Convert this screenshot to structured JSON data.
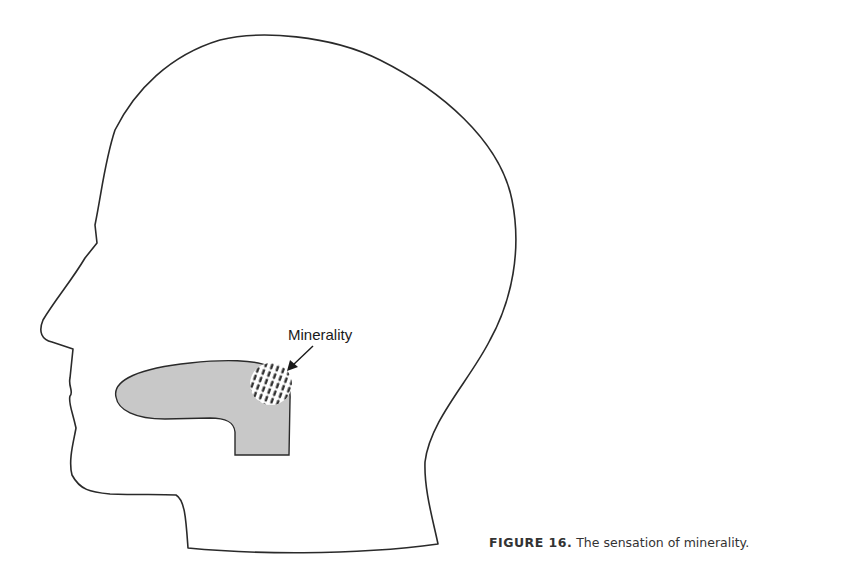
{
  "figure": {
    "label_text": "Minerality",
    "caption_number": "FIGURE 16.",
    "caption_text": " The sensation of minerality."
  },
  "colors": {
    "outline": "#2a2a2a",
    "tongue_fill": "#c8c8c8",
    "hatch": "#2a2a2a",
    "background": "#ffffff"
  }
}
